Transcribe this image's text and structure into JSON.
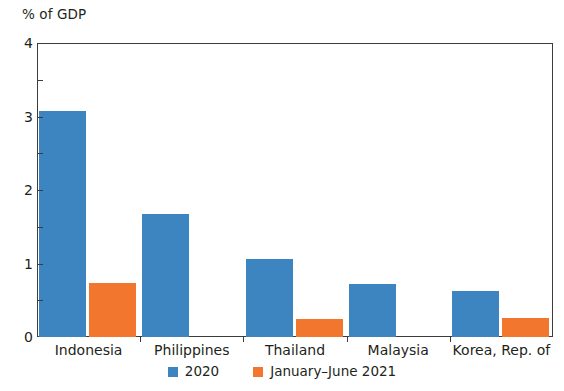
{
  "chart_data": {
    "type": "bar",
    "title": "",
    "subtitle": "",
    "xlabel": "",
    "ylabel": "% of GDP",
    "ylim": [
      0,
      4
    ],
    "ytick_labels": [
      "0",
      "1",
      "2",
      "3",
      "4"
    ],
    "ytick_values": [
      0,
      1,
      2,
      3,
      4
    ],
    "yminor_values": [
      0.5,
      1.5,
      2.5,
      3.5
    ],
    "grid": false,
    "legend_position": "bottom-center",
    "categories": [
      "Indonesia",
      "Philippines",
      "Thailand",
      "Malaysia",
      "Korea, Rep. of"
    ],
    "series": [
      {
        "name": "2020",
        "color": "#3d85c0",
        "values": [
          3.08,
          1.67,
          1.06,
          0.72,
          0.62
        ]
      },
      {
        "name": "January–June 2021",
        "color": "#f2762e",
        "values": [
          0.73,
          0.0,
          0.24,
          0.0,
          0.26
        ]
      }
    ]
  },
  "axis": {
    "y_title": "% of GDP"
  },
  "legend": {
    "items": [
      {
        "label": "2020",
        "color": "#3d85c0"
      },
      {
        "label": "January–June 2021",
        "color": "#f2762e"
      }
    ]
  },
  "colors": {
    "series_2020": "#3d85c0",
    "series_2021": "#f2762e",
    "frame": "#3c3c3c",
    "text": "#231f20",
    "background": "#ffffff"
  }
}
